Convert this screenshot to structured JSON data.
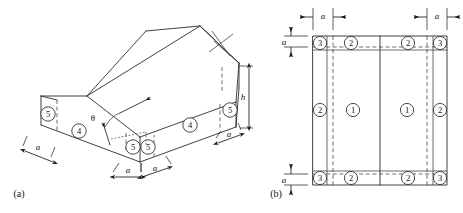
{
  "figure": {
    "panels": [
      {
        "id": "a",
        "label": "(a)",
        "caption_type": "isometric-view"
      },
      {
        "id": "b",
        "label": "(b)",
        "caption_type": "plan-view"
      }
    ],
    "symbols": {
      "edge_distance": "a",
      "eave_height": "h",
      "roof_pitch_angle": "θ"
    },
    "isometric": {
      "zone_markers": [
        {
          "zone": "5",
          "position": "left-gable-upper"
        },
        {
          "zone": "4",
          "position": "left-gable-wall"
        },
        {
          "zone": "5",
          "position": "front-corner-left"
        },
        {
          "zone": "5",
          "position": "front-corner-right"
        },
        {
          "zone": "4",
          "position": "front-long-wall"
        },
        {
          "zone": "5",
          "position": "right-end-wall"
        }
      ],
      "dimension_labels": [
        {
          "text": "a",
          "position": "left-eave"
        },
        {
          "text": "a",
          "position": "bottom-left"
        },
        {
          "text": "a",
          "position": "bottom-right"
        },
        {
          "text": "a",
          "position": "right-lower"
        },
        {
          "text": "h",
          "position": "right-vertical"
        },
        {
          "text": "θ",
          "position": "roof-slope-angle"
        }
      ]
    },
    "plan": {
      "zone_markers": [
        {
          "zone": "3",
          "position": "top-left-corner"
        },
        {
          "zone": "2",
          "position": "top-left-edge"
        },
        {
          "zone": "2",
          "position": "top-right-edge"
        },
        {
          "zone": "3",
          "position": "top-right-corner"
        },
        {
          "zone": "2",
          "position": "mid-left-edge"
        },
        {
          "zone": "1",
          "position": "left-field"
        },
        {
          "zone": "1",
          "position": "right-field"
        },
        {
          "zone": "2",
          "position": "mid-right-edge"
        },
        {
          "zone": "3",
          "position": "bottom-left-corner"
        },
        {
          "zone": "2",
          "position": "bottom-left-edge"
        },
        {
          "zone": "2",
          "position": "bottom-right-edge"
        },
        {
          "zone": "3",
          "position": "bottom-right-corner"
        }
      ],
      "dimension_labels": [
        {
          "text": "a",
          "position": "top-left-width"
        },
        {
          "text": "a",
          "position": "top-right-width"
        },
        {
          "text": "a",
          "position": "left-top-height"
        },
        {
          "text": "a",
          "position": "left-bottom-height"
        }
      ],
      "ridge_line": "center-vertical"
    },
    "colors": {
      "line": "#2b2b2b",
      "dimension": "#1a1a1a",
      "background": "#ffffff",
      "text": "#111111"
    }
  }
}
